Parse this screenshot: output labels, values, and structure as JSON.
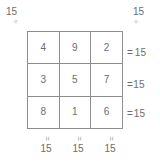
{
  "figure": {
    "type": "magic-square",
    "magic_constant": "15",
    "grid": {
      "rows": [
        [
          "4",
          "9",
          "2"
        ],
        [
          "3",
          "5",
          "7"
        ],
        [
          "8",
          "1",
          "6"
        ]
      ]
    },
    "row_sums": [
      {
        "equals": "=",
        "value": "15"
      },
      {
        "equals": "=",
        "value": "15"
      },
      {
        "equals": "=",
        "value": "15"
      }
    ],
    "column_sums": [
      {
        "equals": "=",
        "value": "15"
      },
      {
        "equals": "=",
        "value": "15"
      },
      {
        "equals": "=",
        "value": "15"
      }
    ],
    "diagonal_sums": [
      {
        "position": "top-left",
        "equals": "=",
        "value": "15"
      },
      {
        "position": "top-right",
        "equals": "=",
        "value": "15"
      }
    ],
    "colors": {
      "background": "#ffffff",
      "grid_line": "#8d8d8d",
      "text": "#6d6d6d",
      "mark": "#a8a8a8"
    }
  }
}
